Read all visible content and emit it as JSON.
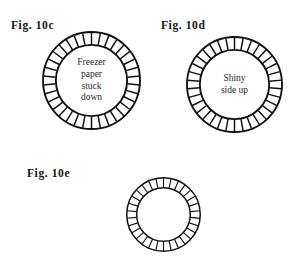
{
  "page": {
    "background_color": "#ffffff",
    "ink_color": "#111111",
    "document_type": "patent-style figure sheet"
  },
  "figures": [
    {
      "id": "fig-10c",
      "label": "Fig. 10c",
      "caption_lines": [
        "Freezer",
        "paper",
        "stuck",
        "down"
      ],
      "diagram": {
        "name": "tick-ring",
        "outer_radius": 49,
        "inner_radius": 36,
        "tick_count": 34,
        "stroke_color": "#111111",
        "outer_stroke_width": 1.9,
        "inner_stroke_width": 1.9,
        "tick_stroke_width": 1.5
      }
    },
    {
      "id": "fig-10d",
      "label": "Fig. 10d",
      "caption_lines": [
        "Shiny",
        "side up"
      ],
      "diagram": {
        "name": "tick-ring",
        "outer_radius": 48,
        "inner_radius": 35,
        "tick_count": 34,
        "stroke_color": "#111111",
        "outer_stroke_width": 1.9,
        "inner_stroke_width": 1.9,
        "tick_stroke_width": 1.5
      }
    },
    {
      "id": "fig-10e",
      "label": "Fig. 10e",
      "caption_lines": [],
      "diagram": {
        "name": "tick-ring",
        "outer_radius": 37,
        "inner_radius": 27,
        "tick_count": 30,
        "stroke_color": "#111111",
        "outer_stroke_width": 2.0,
        "inner_stroke_width": 2.0,
        "tick_stroke_width": 1.5
      }
    }
  ]
}
